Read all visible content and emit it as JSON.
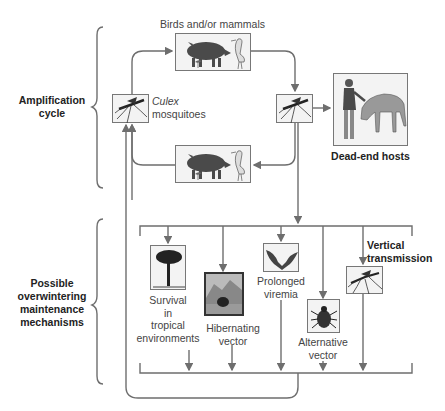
{
  "amplification": {
    "section_label_line1": "Amplification",
    "section_label_line2": "cycle",
    "hosts_label": "Birds and/or mammals",
    "vector_label_italic": "Culex",
    "vector_label_rest": "mosquitoes",
    "dead_end_label": "Dead-end hosts",
    "icons": [
      "pig-icon",
      "heron-icon",
      "small-bird-icon",
      "mosquito-icon",
      "person-icon",
      "horse-icon"
    ]
  },
  "overwintering": {
    "section_label_lines": [
      "Possible",
      "overwintering",
      "maintenance",
      "mechanisms"
    ],
    "mechanisms": [
      {
        "id": "tropical",
        "lines": [
          "Survival",
          "in",
          "tropical",
          "environments"
        ],
        "icon": "palm-tree-icon"
      },
      {
        "id": "hibernating",
        "lines": [
          "Hibernating",
          "vector"
        ],
        "icon": "mountain-cave-icon"
      },
      {
        "id": "viremia",
        "lines": [
          "Prolonged",
          "viremia"
        ],
        "icon": "bat-icon"
      },
      {
        "id": "alternative",
        "lines": [
          "Alternative",
          "vector"
        ],
        "icon": "tick-icon"
      },
      {
        "id": "vertical",
        "lines": [
          "Vertical",
          "transmission"
        ],
        "icon": "mosquito-icon",
        "bold": true
      }
    ]
  },
  "colors": {
    "line": "#6e6e6e",
    "box_border": "#777777",
    "box_fill": "#f3f3f3",
    "animal": "#4a4a4a"
  }
}
